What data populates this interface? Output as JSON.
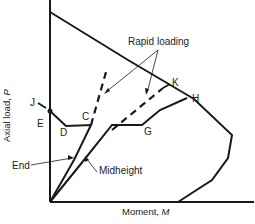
{
  "diagram": {
    "type": "interaction-diagram",
    "x_axis_label": "Moment, ",
    "x_axis_symbol": "M",
    "y_axis_label": "Axial load, ",
    "y_axis_symbol": "P",
    "annotations": {
      "rapid_loading": "Rapid loading",
      "end": "End",
      "midheight": "Midheight"
    },
    "points": {
      "J": "J",
      "E": "E",
      "D": "D",
      "C": "C",
      "G": "G",
      "K": "K",
      "H": "H"
    },
    "colors": {
      "line": "#1a1a1a",
      "background": "#ffffff"
    }
  }
}
